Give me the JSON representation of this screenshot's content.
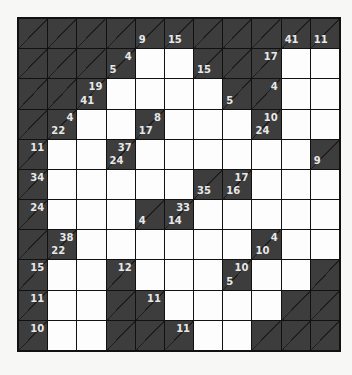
{
  "puzzle": {
    "type": "kakuro",
    "rows": 11,
    "cols": 11,
    "colors": {
      "block": "#3d3d3d",
      "white": "#fdfdfd",
      "clue_text": "#e8e8e8",
      "grid_line": "#111111"
    },
    "grid": [
      [
        {
          "b": 1
        },
        {
          "b": 1
        },
        {
          "b": 1
        },
        {
          "b": 1
        },
        {
          "b": 1,
          "d": "9"
        },
        {
          "b": 1,
          "d": "15"
        },
        {
          "b": 1
        },
        {
          "b": 1
        },
        {
          "b": 1
        },
        {
          "b": 1,
          "d": "41"
        },
        {
          "b": 1,
          "d": "11"
        }
      ],
      [
        {
          "b": 1
        },
        {
          "b": 1
        },
        {
          "b": 1
        },
        {
          "b": 1,
          "a": "4",
          "d": "5"
        },
        {
          "b": 0
        },
        {
          "b": 0
        },
        {
          "b": 1,
          "d": "15"
        },
        {
          "b": 1
        },
        {
          "b": 1,
          "a": "17"
        },
        {
          "b": 0
        },
        {
          "b": 0
        }
      ],
      [
        {
          "b": 1
        },
        {
          "b": 1
        },
        {
          "b": 1,
          "a": "19",
          "d": "41"
        },
        {
          "b": 0
        },
        {
          "b": 0
        },
        {
          "b": 0
        },
        {
          "b": 0
        },
        {
          "b": 1,
          "d": "5"
        },
        {
          "b": 1,
          "a": "4"
        },
        {
          "b": 0
        },
        {
          "b": 0
        }
      ],
      [
        {
          "b": 1
        },
        {
          "b": 1,
          "a": "4",
          "d": "22"
        },
        {
          "b": 0
        },
        {
          "b": 0
        },
        {
          "b": 1,
          "a": "8",
          "d": "17"
        },
        {
          "b": 0
        },
        {
          "b": 0
        },
        {
          "b": 0
        },
        {
          "b": 1,
          "a": "10",
          "d": "24"
        },
        {
          "b": 0
        },
        {
          "b": 0
        }
      ],
      [
        {
          "b": 1,
          "a": "11"
        },
        {
          "b": 0
        },
        {
          "b": 0
        },
        {
          "b": 1,
          "a": "37",
          "d": "24"
        },
        {
          "b": 0
        },
        {
          "b": 0
        },
        {
          "b": 0
        },
        {
          "b": 0
        },
        {
          "b": 0
        },
        {
          "b": 0
        },
        {
          "b": 1,
          "d": "9"
        }
      ],
      [
        {
          "b": 1,
          "a": "34"
        },
        {
          "b": 0
        },
        {
          "b": 0
        },
        {
          "b": 0
        },
        {
          "b": 0
        },
        {
          "b": 0
        },
        {
          "b": 1,
          "d": "35"
        },
        {
          "b": 1,
          "a": "17",
          "d": "16"
        },
        {
          "b": 0
        },
        {
          "b": 0
        },
        {
          "b": 0
        }
      ],
      [
        {
          "b": 1,
          "a": "24"
        },
        {
          "b": 0
        },
        {
          "b": 0
        },
        {
          "b": 0
        },
        {
          "b": 1,
          "d": "4"
        },
        {
          "b": 1,
          "a": "33",
          "d": "14"
        },
        {
          "b": 0
        },
        {
          "b": 0
        },
        {
          "b": 0
        },
        {
          "b": 0
        },
        {
          "b": 0
        }
      ],
      [
        {
          "b": 1
        },
        {
          "b": 1,
          "a": "38",
          "d": "22"
        },
        {
          "b": 0
        },
        {
          "b": 0
        },
        {
          "b": 0
        },
        {
          "b": 0
        },
        {
          "b": 0
        },
        {
          "b": 0
        },
        {
          "b": 1,
          "a": "4",
          "d": "10"
        },
        {
          "b": 0
        },
        {
          "b": 0
        }
      ],
      [
        {
          "b": 1,
          "a": "15"
        },
        {
          "b": 0
        },
        {
          "b": 0
        },
        {
          "b": 1,
          "a": "12"
        },
        {
          "b": 0
        },
        {
          "b": 0
        },
        {
          "b": 0
        },
        {
          "b": 1,
          "a": "10",
          "d": "5"
        },
        {
          "b": 0
        },
        {
          "b": 0
        },
        {
          "b": 1
        }
      ],
      [
        {
          "b": 1,
          "a": "11"
        },
        {
          "b": 0
        },
        {
          "b": 0
        },
        {
          "b": 1
        },
        {
          "b": 1,
          "a": "11"
        },
        {
          "b": 0
        },
        {
          "b": 0
        },
        {
          "b": 0
        },
        {
          "b": 0
        },
        {
          "b": 1
        },
        {
          "b": 1
        }
      ],
      [
        {
          "b": 1,
          "a": "10"
        },
        {
          "b": 0
        },
        {
          "b": 0
        },
        {
          "b": 1
        },
        {
          "b": 1
        },
        {
          "b": 1,
          "a": "11"
        },
        {
          "b": 0
        },
        {
          "b": 0
        },
        {
          "b": 1
        },
        {
          "b": 1
        },
        {
          "b": 1
        }
      ]
    ]
  }
}
